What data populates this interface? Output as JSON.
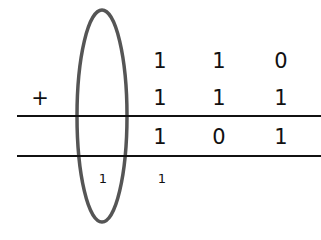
{
  "operator": "+",
  "addend_1": [
    "1",
    "1",
    "0"
  ],
  "addend_2": [
    "1",
    "1",
    "1"
  ],
  "sum": [
    "1",
    "0",
    "1"
  ],
  "carries": [
    "1",
    "1"
  ],
  "highlight": {
    "shape": "ellipse",
    "color": "#555555"
  }
}
